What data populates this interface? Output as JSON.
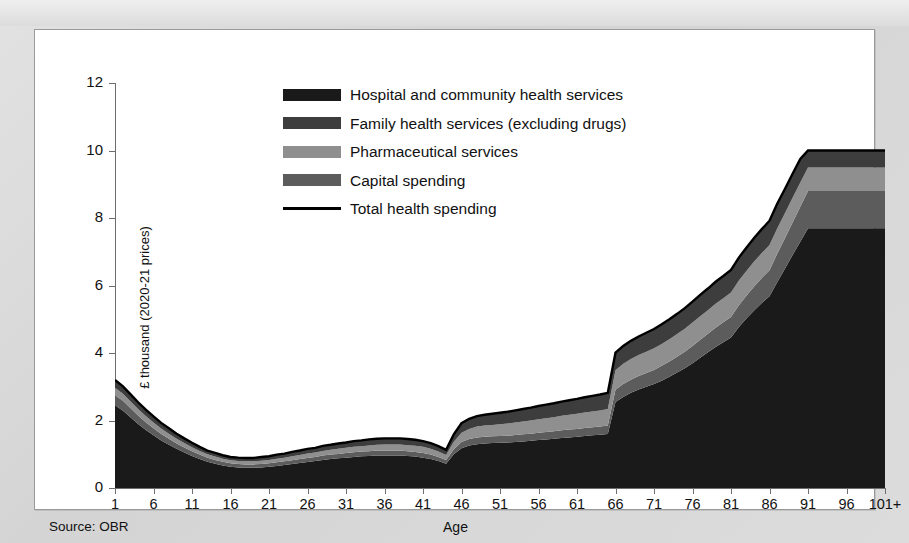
{
  "source_note": "Source: OBR",
  "axes": {
    "y_title": "£ thousand (2020-21 prices)",
    "x_title": "Age",
    "y_ticks": [
      "0",
      "2",
      "4",
      "6",
      "8",
      "10",
      "12"
    ],
    "x_ticks": [
      "1",
      "6",
      "11",
      "16",
      "21",
      "26",
      "31",
      "36",
      "41",
      "46",
      "51",
      "56",
      "61",
      "66",
      "71",
      "76",
      "81",
      "86",
      "91",
      "96",
      "101+"
    ]
  },
  "legend": {
    "items": [
      {
        "label": "Hospital and community health services",
        "color": "#1a1a1a",
        "marker": "swatch"
      },
      {
        "label": "Family health services (excluding drugs)",
        "color": "#3d3d3d",
        "marker": "swatch"
      },
      {
        "label": "Pharmaceutical services",
        "color": "#8f8f8f",
        "marker": "swatch"
      },
      {
        "label": "Capital spending",
        "color": "#5c5c5c",
        "marker": "swatch"
      },
      {
        "label": "Total health spending",
        "color": "#000000",
        "marker": "line"
      }
    ]
  },
  "chart_data": {
    "type": "area",
    "stacked": true,
    "title": "",
    "xlabel": "Age",
    "ylabel": "£ thousand (2020-21 prices)",
    "xlim": [
      1,
      101
    ],
    "ylim": [
      0,
      12
    ],
    "grid": false,
    "legend_position": "top-center",
    "x": [
      1,
      2,
      3,
      4,
      5,
      6,
      7,
      8,
      9,
      10,
      11,
      12,
      13,
      14,
      15,
      16,
      17,
      18,
      19,
      20,
      21,
      22,
      23,
      24,
      25,
      26,
      27,
      28,
      29,
      30,
      31,
      32,
      33,
      34,
      35,
      36,
      37,
      38,
      39,
      40,
      41,
      42,
      43,
      44,
      45,
      46,
      47,
      48,
      49,
      50,
      51,
      52,
      53,
      54,
      55,
      56,
      57,
      58,
      59,
      60,
      61,
      62,
      63,
      64,
      65,
      66,
      67,
      68,
      69,
      70,
      71,
      72,
      73,
      74,
      75,
      76,
      77,
      78,
      79,
      80,
      81,
      82,
      83,
      84,
      85,
      86,
      87,
      88,
      89,
      90,
      91,
      92,
      93,
      94,
      95,
      96,
      97,
      98,
      99,
      100,
      101
    ],
    "series": [
      {
        "name": "Hospital and community health services",
        "color": "#1a1a1a",
        "values": [
          2.45,
          2.3,
          2.1,
          1.9,
          1.72,
          1.56,
          1.41,
          1.28,
          1.16,
          1.05,
          0.95,
          0.86,
          0.78,
          0.72,
          0.67,
          0.63,
          0.61,
          0.6,
          0.6,
          0.61,
          0.63,
          0.65,
          0.68,
          0.71,
          0.74,
          0.77,
          0.8,
          0.83,
          0.86,
          0.88,
          0.9,
          0.92,
          0.94,
          0.95,
          0.96,
          0.96,
          0.96,
          0.96,
          0.95,
          0.93,
          0.9,
          0.86,
          0.8,
          0.72,
          1.0,
          1.18,
          1.26,
          1.3,
          1.32,
          1.33,
          1.34,
          1.35,
          1.36,
          1.38,
          1.4,
          1.42,
          1.44,
          1.46,
          1.48,
          1.5,
          1.52,
          1.54,
          1.56,
          1.58,
          1.6,
          2.55,
          2.7,
          2.82,
          2.92,
          3.0,
          3.08,
          3.18,
          3.3,
          3.42,
          3.55,
          3.7,
          3.86,
          4.02,
          4.18,
          4.32,
          4.46,
          4.76,
          5.02,
          5.26,
          5.48,
          5.68,
          6.1,
          6.5,
          6.9,
          7.3,
          7.7,
          7.7,
          7.7,
          7.7,
          7.7,
          7.7,
          7.7,
          7.7,
          7.7,
          7.7,
          7.7
        ]
      },
      {
        "name": "Capital spending",
        "color": "#5c5c5c",
        "values": [
          0.3,
          0.29,
          0.27,
          0.25,
          0.23,
          0.21,
          0.19,
          0.18,
          0.16,
          0.15,
          0.14,
          0.13,
          0.12,
          0.11,
          0.11,
          0.1,
          0.1,
          0.1,
          0.1,
          0.1,
          0.1,
          0.11,
          0.11,
          0.11,
          0.12,
          0.12,
          0.12,
          0.13,
          0.13,
          0.13,
          0.14,
          0.14,
          0.14,
          0.14,
          0.15,
          0.15,
          0.15,
          0.15,
          0.14,
          0.14,
          0.14,
          0.13,
          0.12,
          0.11,
          0.15,
          0.18,
          0.19,
          0.2,
          0.2,
          0.2,
          0.2,
          0.2,
          0.21,
          0.21,
          0.21,
          0.22,
          0.22,
          0.22,
          0.23,
          0.23,
          0.23,
          0.24,
          0.24,
          0.24,
          0.25,
          0.36,
          0.38,
          0.39,
          0.4,
          0.41,
          0.42,
          0.44,
          0.45,
          0.47,
          0.49,
          0.51,
          0.53,
          0.55,
          0.57,
          0.59,
          0.61,
          0.65,
          0.68,
          0.71,
          0.74,
          0.77,
          0.84,
          0.9,
          0.97,
          1.03,
          1.1,
          1.1,
          1.1,
          1.1,
          1.1,
          1.1,
          1.1,
          1.1,
          1.1,
          1.1,
          1.1
        ]
      },
      {
        "name": "Pharmaceutical services",
        "color": "#8f8f8f",
        "values": [
          0.22,
          0.21,
          0.2,
          0.19,
          0.18,
          0.17,
          0.16,
          0.15,
          0.14,
          0.13,
          0.12,
          0.11,
          0.1,
          0.1,
          0.09,
          0.09,
          0.09,
          0.09,
          0.09,
          0.1,
          0.1,
          0.11,
          0.11,
          0.12,
          0.12,
          0.13,
          0.13,
          0.14,
          0.14,
          0.15,
          0.15,
          0.16,
          0.16,
          0.17,
          0.17,
          0.18,
          0.18,
          0.18,
          0.18,
          0.18,
          0.18,
          0.17,
          0.16,
          0.15,
          0.22,
          0.28,
          0.3,
          0.32,
          0.33,
          0.34,
          0.35,
          0.36,
          0.37,
          0.38,
          0.39,
          0.4,
          0.41,
          0.42,
          0.43,
          0.44,
          0.45,
          0.46,
          0.47,
          0.48,
          0.49,
          0.58,
          0.6,
          0.61,
          0.62,
          0.63,
          0.64,
          0.65,
          0.66,
          0.67,
          0.68,
          0.69,
          0.7,
          0.7,
          0.71,
          0.71,
          0.72,
          0.73,
          0.73,
          0.74,
          0.74,
          0.75,
          0.75,
          0.74,
          0.73,
          0.72,
          0.7,
          0.7,
          0.7,
          0.7,
          0.7,
          0.7,
          0.7,
          0.7,
          0.7,
          0.7,
          0.7
        ]
      },
      {
        "name": "Family health services (excluding drugs)",
        "color": "#3d3d3d",
        "values": [
          0.23,
          0.22,
          0.21,
          0.2,
          0.19,
          0.18,
          0.17,
          0.16,
          0.15,
          0.14,
          0.13,
          0.12,
          0.11,
          0.11,
          0.1,
          0.1,
          0.1,
          0.1,
          0.1,
          0.11,
          0.11,
          0.12,
          0.12,
          0.13,
          0.13,
          0.14,
          0.14,
          0.15,
          0.15,
          0.16,
          0.16,
          0.17,
          0.17,
          0.18,
          0.18,
          0.18,
          0.18,
          0.18,
          0.18,
          0.18,
          0.17,
          0.17,
          0.16,
          0.15,
          0.22,
          0.28,
          0.3,
          0.31,
          0.32,
          0.33,
          0.34,
          0.35,
          0.36,
          0.37,
          0.38,
          0.39,
          0.4,
          0.41,
          0.42,
          0.43,
          0.44,
          0.45,
          0.46,
          0.47,
          0.48,
          0.52,
          0.53,
          0.54,
          0.55,
          0.56,
          0.57,
          0.58,
          0.59,
          0.6,
          0.61,
          0.62,
          0.63,
          0.64,
          0.65,
          0.66,
          0.67,
          0.68,
          0.69,
          0.7,
          0.71,
          0.72,
          0.73,
          0.72,
          0.71,
          0.7,
          0.5,
          0.5,
          0.5,
          0.5,
          0.5,
          0.5,
          0.5,
          0.5,
          0.5,
          0.5,
          0.5
        ]
      }
    ],
    "total_line": {
      "name": "Total health spending",
      "color": "#000000",
      "values": [
        3.2,
        3.02,
        2.78,
        2.54,
        2.32,
        2.12,
        1.93,
        1.77,
        1.61,
        1.47,
        1.34,
        1.22,
        1.11,
        1.04,
        0.97,
        0.92,
        0.9,
        0.89,
        0.89,
        0.92,
        0.94,
        0.99,
        1.02,
        1.07,
        1.11,
        1.16,
        1.19,
        1.25,
        1.28,
        1.32,
        1.35,
        1.39,
        1.41,
        1.44,
        1.46,
        1.47,
        1.47,
        1.47,
        1.45,
        1.43,
        1.39,
        1.33,
        1.24,
        1.13,
        1.59,
        1.92,
        2.05,
        2.13,
        2.17,
        2.2,
        2.23,
        2.26,
        2.3,
        2.34,
        2.38,
        2.43,
        2.47,
        2.51,
        2.56,
        2.6,
        2.64,
        2.69,
        2.73,
        2.77,
        2.82,
        4.01,
        4.21,
        4.36,
        4.49,
        4.6,
        4.71,
        4.85,
        5.0,
        5.16,
        5.33,
        5.52,
        5.72,
        5.91,
        6.11,
        6.28,
        6.46,
        6.82,
        7.12,
        7.41,
        7.67,
        7.92,
        8.42,
        8.86,
        9.31,
        9.75,
        10.0,
        10.0,
        10.0,
        10.0,
        10.0,
        10.0,
        10.0,
        10.0,
        10.0,
        10.0,
        10.0
      ]
    }
  }
}
